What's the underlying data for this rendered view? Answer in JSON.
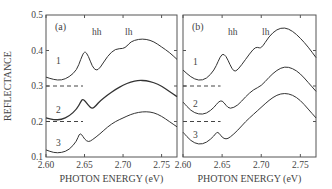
{
  "chart_data": [
    {
      "panel": "(a)",
      "type": "line",
      "xlabel": "PHOTON ENERGY (eV)",
      "ylabel": "REFLECTANCE",
      "xlim": [
        2.6,
        2.77
      ],
      "ylim": [
        0.1,
        0.5
      ],
      "xticks": [
        "2.60",
        "2.65",
        "2.70",
        "2.75"
      ],
      "yticks": [
        "0.1",
        "0.2",
        "0.3",
        "0.4",
        "0.5"
      ],
      "annotations": [
        "hh",
        "lh"
      ],
      "baselines": [
        0.3,
        0.2
      ],
      "series": [
        {
          "name": "1",
          "x": [
            2.6,
            2.61,
            2.62,
            2.63,
            2.64,
            2.645,
            2.65,
            2.655,
            2.66,
            2.665,
            2.67,
            2.68,
            2.69,
            2.7,
            2.705,
            2.71,
            2.72,
            2.73,
            2.74,
            2.75,
            2.76,
            2.77
          ],
          "y": [
            0.325,
            0.318,
            0.316,
            0.325,
            0.345,
            0.375,
            0.4,
            0.385,
            0.355,
            0.343,
            0.35,
            0.385,
            0.405,
            0.405,
            0.412,
            0.425,
            0.432,
            0.432,
            0.425,
            0.41,
            0.395,
            0.375
          ]
        },
        {
          "name": "2",
          "x": [
            2.6,
            2.61,
            2.62,
            2.63,
            2.64,
            2.645,
            2.648,
            2.655,
            2.66,
            2.665,
            2.67,
            2.68,
            2.69,
            2.7,
            2.71,
            2.72,
            2.73,
            2.74,
            2.75,
            2.76,
            2.77
          ],
          "y": [
            0.21,
            0.205,
            0.205,
            0.215,
            0.235,
            0.255,
            0.265,
            0.245,
            0.235,
            0.245,
            0.258,
            0.275,
            0.29,
            0.302,
            0.312,
            0.316,
            0.315,
            0.31,
            0.3,
            0.285,
            0.27
          ]
        },
        {
          "name": "3",
          "x": [
            2.6,
            2.61,
            2.62,
            2.63,
            2.64,
            2.643,
            2.646,
            2.65,
            2.655,
            2.66,
            2.67,
            2.68,
            2.69,
            2.7,
            2.71,
            2.72,
            2.73,
            2.74,
            2.75,
            2.76,
            2.77
          ],
          "y": [
            0.12,
            0.112,
            0.112,
            0.12,
            0.145,
            0.165,
            0.165,
            0.15,
            0.142,
            0.148,
            0.165,
            0.185,
            0.2,
            0.21,
            0.22,
            0.226,
            0.228,
            0.225,
            0.215,
            0.2,
            0.185
          ]
        }
      ]
    },
    {
      "panel": "(b)",
      "type": "line",
      "xlabel": "PHOTON ENERGY (eV)",
      "ylabel": "",
      "xlim": [
        2.6,
        2.77
      ],
      "ylim": [
        0.1,
        0.5
      ],
      "xticks": [
        "2.60",
        "2.65",
        "2.70",
        "2.75"
      ],
      "annotations": [
        "hh",
        "lh"
      ],
      "baselines": [
        0.3,
        0.2
      ],
      "series": [
        {
          "name": "1",
          "x": [
            2.6,
            2.61,
            2.62,
            2.63,
            2.64,
            2.645,
            2.65,
            2.655,
            2.66,
            2.665,
            2.67,
            2.68,
            2.69,
            2.695,
            2.7,
            2.71,
            2.72,
            2.73,
            2.74,
            2.75,
            2.76,
            2.77
          ],
          "y": [
            0.345,
            0.325,
            0.315,
            0.32,
            0.345,
            0.37,
            0.392,
            0.385,
            0.36,
            0.34,
            0.345,
            0.375,
            0.405,
            0.41,
            0.405,
            0.44,
            0.46,
            0.465,
            0.455,
            0.435,
            0.41,
            0.38
          ]
        },
        {
          "name": "2",
          "x": [
            2.6,
            2.61,
            2.62,
            2.63,
            2.64,
            2.645,
            2.65,
            2.655,
            2.66,
            2.67,
            2.68,
            2.69,
            2.7,
            2.71,
            2.72,
            2.73,
            2.74,
            2.75,
            2.76,
            2.77
          ],
          "y": [
            0.255,
            0.23,
            0.22,
            0.222,
            0.24,
            0.255,
            0.26,
            0.245,
            0.235,
            0.245,
            0.27,
            0.29,
            0.3,
            0.325,
            0.345,
            0.355,
            0.35,
            0.335,
            0.31,
            0.285
          ]
        },
        {
          "name": "3",
          "x": [
            2.6,
            2.61,
            2.62,
            2.63,
            2.64,
            2.643,
            2.646,
            2.65,
            2.655,
            2.66,
            2.67,
            2.68,
            2.69,
            2.7,
            2.71,
            2.72,
            2.73,
            2.74,
            2.75,
            2.76,
            2.77
          ],
          "y": [
            0.17,
            0.145,
            0.135,
            0.14,
            0.16,
            0.17,
            0.168,
            0.155,
            0.15,
            0.155,
            0.175,
            0.2,
            0.22,
            0.24,
            0.26,
            0.275,
            0.28,
            0.275,
            0.26,
            0.235,
            0.21
          ]
        }
      ]
    }
  ]
}
